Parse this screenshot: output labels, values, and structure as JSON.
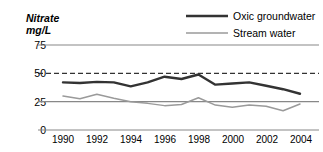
{
  "chart_data": {
    "type": "line",
    "title": "",
    "ylabel": "Nitrate mg/L",
    "ylabel_lines": [
      "Nitrate",
      "mg/L"
    ],
    "xlabel": "",
    "ylim": [
      0,
      75
    ],
    "xlim": [
      1990,
      2004
    ],
    "yticks": [
      0,
      25,
      50,
      75
    ],
    "ytick_labels": [
      "0",
      "25",
      "50",
      "75"
    ],
    "xticks": [
      1990,
      1992,
      1994,
      1996,
      1998,
      2000,
      2002,
      2004
    ],
    "xtick_labels": [
      "1990",
      "1992",
      "1994",
      "1996",
      "1998",
      "2000",
      "2002",
      "2004"
    ],
    "grid": true,
    "gridlines": [
      {
        "value": 75,
        "style": "solid",
        "color": "#888888"
      },
      {
        "value": 50,
        "style": "dashed",
        "color": "#333333"
      },
      {
        "value": 25,
        "style": "solid",
        "color": "#888888"
      },
      {
        "value": 0,
        "style": "solid",
        "color": "#888888"
      }
    ],
    "legend_position": "top-right",
    "x": [
      1990,
      1991,
      1992,
      1993,
      1994,
      1995,
      1996,
      1997,
      1998,
      1999,
      2000,
      2001,
      2002,
      2003,
      2004
    ],
    "series": [
      {
        "name": "Oxic groundwater",
        "color": "#333333",
        "width": 2.4,
        "values": [
          42,
          41.5,
          42.5,
          42,
          38.5,
          42,
          47,
          45,
          49,
          40,
          41,
          42,
          39,
          36,
          32
        ]
      },
      {
        "name": "Stream water",
        "color": "#9a9a9a",
        "width": 1.5,
        "values": [
          30,
          27.5,
          31.5,
          28,
          25,
          23.5,
          21.5,
          22.5,
          28.5,
          22,
          20,
          22,
          21,
          17,
          23
        ]
      }
    ]
  },
  "legend": {
    "items": [
      {
        "label": "Oxic groundwater",
        "color": "#333333"
      },
      {
        "label": "Stream water",
        "color": "#9a9a9a"
      }
    ]
  }
}
